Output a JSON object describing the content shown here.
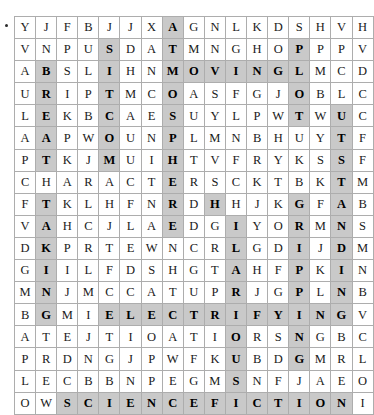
{
  "puzzle": {
    "type": "word-search",
    "rows": 17,
    "cols": 17,
    "highlight_color": "#c9c9c9",
    "grid_border_color": "#8d8d8d",
    "cell_border_color": "#adadad",
    "text_color": "#1a1a1a",
    "bullet_marker": "•",
    "grid": [
      [
        "Y",
        "J",
        "F",
        "B",
        "J",
        "J",
        "X",
        "A",
        "G",
        "N",
        "L",
        "K",
        "D",
        "S",
        "H",
        "V",
        "H"
      ],
      [
        "V",
        "N",
        "P",
        "U",
        "S",
        "D",
        "A",
        "T",
        "M",
        "N",
        "G",
        "H",
        "O",
        "P",
        "P",
        "P",
        "V"
      ],
      [
        "A",
        "B",
        "S",
        "L",
        "I",
        "H",
        "N",
        "M",
        "O",
        "V",
        "I",
        "N",
        "G",
        "L",
        "M",
        "C",
        "D"
      ],
      [
        "U",
        "R",
        "I",
        "P",
        "T",
        "M",
        "C",
        "O",
        "A",
        "S",
        "F",
        "G",
        "J",
        "O",
        "B",
        "L",
        "C"
      ],
      [
        "L",
        "E",
        "K",
        "B",
        "C",
        "A",
        "E",
        "S",
        "U",
        "Y",
        "L",
        "P",
        "W",
        "T",
        "W",
        "U",
        "C"
      ],
      [
        "A",
        "A",
        "P",
        "W",
        "O",
        "U",
        "N",
        "P",
        "L",
        "M",
        "N",
        "B",
        "H",
        "U",
        "Y",
        "T",
        "F"
      ],
      [
        "P",
        "T",
        "K",
        "J",
        "M",
        "U",
        "I",
        "H",
        "T",
        "V",
        "F",
        "R",
        "Y",
        "K",
        "S",
        "S",
        "F"
      ],
      [
        "C",
        "H",
        "A",
        "R",
        "A",
        "C",
        "T",
        "E",
        "R",
        "S",
        "C",
        "K",
        "T",
        "B",
        "K",
        "T",
        "M"
      ],
      [
        "F",
        "T",
        "K",
        "L",
        "H",
        "F",
        "N",
        "R",
        "D",
        "H",
        "H",
        "J",
        "K",
        "G",
        "F",
        "A",
        "B"
      ],
      [
        "V",
        "A",
        "H",
        "C",
        "J",
        "L",
        "A",
        "E",
        "D",
        "G",
        "I",
        "Y",
        "O",
        "R",
        "M",
        "N",
        "S"
      ],
      [
        "D",
        "K",
        "P",
        "R",
        "T",
        "E",
        "W",
        "N",
        "C",
        "R",
        "L",
        "G",
        "D",
        "I",
        "J",
        "D",
        "M"
      ],
      [
        "G",
        "I",
        "I",
        "L",
        "F",
        "D",
        "S",
        "H",
        "G",
        "T",
        "A",
        "H",
        "F",
        "P",
        "K",
        "I",
        "N"
      ],
      [
        "M",
        "N",
        "J",
        "M",
        "C",
        "C",
        "A",
        "T",
        "U",
        "P",
        "R",
        "J",
        "G",
        "P",
        "L",
        "N",
        "B"
      ],
      [
        "B",
        "G",
        "M",
        "I",
        "E",
        "L",
        "E",
        "C",
        "T",
        "R",
        "I",
        "F",
        "Y",
        "I",
        "N",
        "G",
        "V"
      ],
      [
        "A",
        "T",
        "E",
        "J",
        "T",
        "I",
        "O",
        "A",
        "T",
        "I",
        "O",
        "R",
        "S",
        "N",
        "G",
        "B",
        "C"
      ],
      [
        "P",
        "R",
        "D",
        "N",
        "G",
        "J",
        "P",
        "W",
        "F",
        "K",
        "U",
        "B",
        "D",
        "G",
        "M",
        "R",
        "L"
      ],
      [
        "L",
        "E",
        "C",
        "B",
        "B",
        "N",
        "P",
        "E",
        "G",
        "M",
        "S",
        "N",
        "F",
        "J",
        "A",
        "E",
        "O"
      ],
      [
        "O",
        "W",
        "S",
        "C",
        "I",
        "E",
        "N",
        "C",
        "E",
        "F",
        "I",
        "C",
        "T",
        "I",
        "O",
        "N",
        "I"
      ]
    ],
    "highlights": [
      [
        0,
        0,
        0,
        0,
        0,
        0,
        0,
        1,
        0,
        0,
        0,
        0,
        0,
        0,
        0,
        0,
        0
      ],
      [
        0,
        0,
        0,
        0,
        1,
        0,
        0,
        1,
        0,
        0,
        0,
        0,
        0,
        1,
        0,
        0,
        0
      ],
      [
        0,
        1,
        0,
        0,
        1,
        0,
        0,
        1,
        1,
        1,
        1,
        1,
        1,
        1,
        0,
        0,
        0
      ],
      [
        0,
        1,
        0,
        0,
        1,
        0,
        0,
        1,
        0,
        0,
        0,
        0,
        0,
        1,
        0,
        0,
        0
      ],
      [
        0,
        1,
        0,
        0,
        1,
        0,
        0,
        1,
        0,
        0,
        0,
        0,
        0,
        1,
        0,
        1,
        0
      ],
      [
        0,
        1,
        0,
        0,
        1,
        0,
        0,
        1,
        0,
        0,
        0,
        0,
        0,
        0,
        0,
        1,
        0
      ],
      [
        0,
        1,
        0,
        0,
        1,
        0,
        0,
        1,
        0,
        0,
        0,
        0,
        0,
        0,
        0,
        1,
        0
      ],
      [
        0,
        0,
        0,
        0,
        0,
        0,
        0,
        1,
        0,
        0,
        0,
        0,
        0,
        0,
        0,
        1,
        0
      ],
      [
        0,
        1,
        0,
        0,
        0,
        0,
        0,
        1,
        0,
        1,
        0,
        0,
        0,
        1,
        0,
        1,
        0
      ],
      [
        0,
        1,
        0,
        0,
        0,
        0,
        0,
        1,
        0,
        0,
        1,
        0,
        0,
        1,
        0,
        1,
        0
      ],
      [
        0,
        1,
        0,
        0,
        0,
        0,
        0,
        0,
        0,
        0,
        1,
        0,
        0,
        1,
        0,
        1,
        0
      ],
      [
        0,
        1,
        0,
        0,
        0,
        0,
        0,
        0,
        0,
        0,
        1,
        0,
        0,
        1,
        0,
        1,
        0
      ],
      [
        0,
        1,
        0,
        0,
        0,
        0,
        0,
        0,
        0,
        0,
        1,
        0,
        0,
        1,
        0,
        1,
        0
      ],
      [
        0,
        1,
        0,
        0,
        1,
        1,
        1,
        1,
        1,
        1,
        1,
        1,
        1,
        1,
        1,
        1,
        0
      ],
      [
        0,
        0,
        0,
        0,
        0,
        0,
        0,
        0,
        0,
        0,
        1,
        0,
        0,
        1,
        0,
        0,
        0
      ],
      [
        0,
        0,
        0,
        0,
        0,
        0,
        0,
        0,
        0,
        0,
        1,
        0,
        0,
        1,
        0,
        0,
        0
      ],
      [
        0,
        0,
        0,
        0,
        0,
        0,
        0,
        0,
        0,
        0,
        1,
        0,
        0,
        0,
        0,
        0,
        0
      ],
      [
        0,
        0,
        1,
        1,
        1,
        1,
        1,
        1,
        1,
        1,
        1,
        1,
        1,
        1,
        1,
        1,
        0
      ]
    ]
  }
}
